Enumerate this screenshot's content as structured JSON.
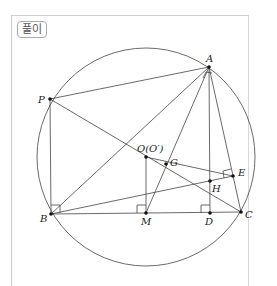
{
  "tag": "풀이",
  "labels": {
    "A": "A",
    "P": "P",
    "O": "O(O′)",
    "G": "G",
    "E": "E",
    "H": "H",
    "B": "B",
    "M": "M",
    "D": "D",
    "C": "C"
  },
  "colors": {
    "line": "#444",
    "frame": "#c8c8c8"
  }
}
